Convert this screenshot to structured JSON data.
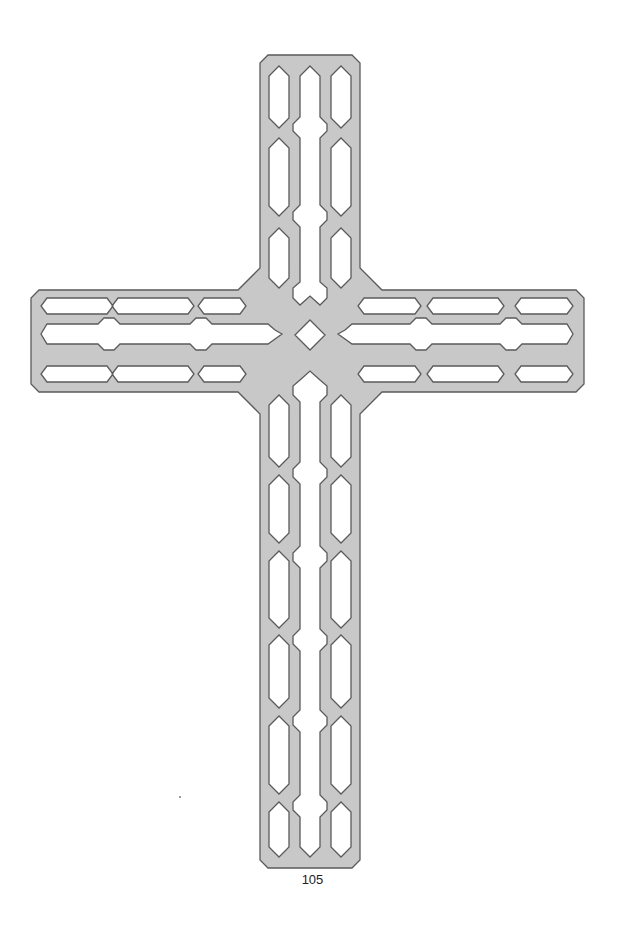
{
  "figure": {
    "fill_color": "#c8c8c8",
    "stroke_color": "#5a5a5a",
    "background_color": "#ffffff"
  },
  "page": {
    "number": "105"
  }
}
